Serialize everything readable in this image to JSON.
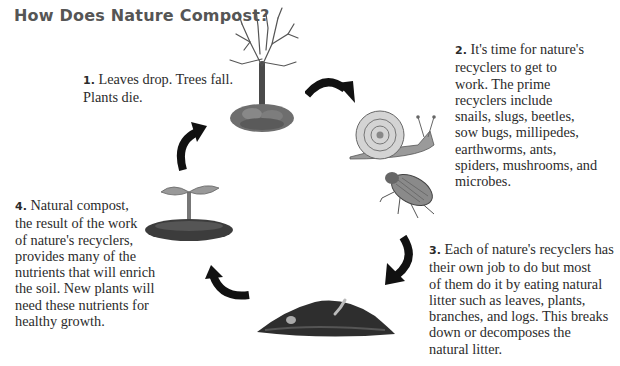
{
  "title": "How Does Nature Compost?",
  "steps": [
    {
      "number": "1.",
      "text": "Leaves drop. Trees fall.\nPlants die."
    },
    {
      "number": "2.",
      "text": "It's time for nature's\nrecyclers to get to\nwork. The prime\nrecyclers include\nsnails, slugs, beetles,\nsow bugs, millipedes,\nearthworms, ants,\nspiders, mushrooms, and\nmicrobes."
    },
    {
      "number": "3.",
      "text": "Each of nature's recyclers has\ntheir own job to do but most\nof them do it by eating natural\nlitter such as leaves, plants,\nbranches, and logs. This breaks\ndown or decomposes the\nnatural litter."
    },
    {
      "number": "4.",
      "text": "Natural compost,\nthe result of the work\nof nature's recyclers,\nprovides many of the\nnutrients that will enrich\nthe soil. New plants will\nneed these nutrients for\nhealthy growth."
    }
  ],
  "illustrations": {
    "tree": "bare-tree-with-fallen-leaves",
    "snail": "snail",
    "beetle": "beetle",
    "compost": "compost-pile",
    "seedling": "seedling-sprout"
  },
  "arrows": [
    "arrow-tree-to-snail",
    "arrow-beetle-to-compost",
    "arrow-compost-to-seedling",
    "arrow-seedling-to-tree"
  ],
  "colors": {
    "title": "#555555",
    "text": "#2b2b2b",
    "arrow": "#111111",
    "background": "#ffffff"
  }
}
